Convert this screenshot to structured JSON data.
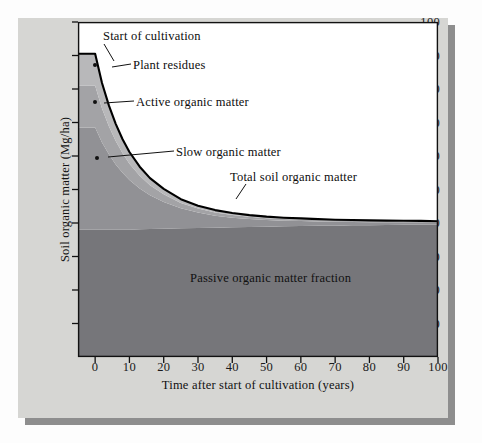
{
  "figure": {
    "panel_color": "#d6d6d3",
    "shadow_color": "#8e8e8e",
    "plot_background": "#ffffff",
    "frame_color": "#111111"
  },
  "chart_data": {
    "type": "area",
    "title": "",
    "xlabel": "Time after start of cultivation (years)",
    "ylabel": "Soil organic matter (Mg/ha)",
    "xlim": [
      -5,
      100
    ],
    "ylim": [
      0,
      100
    ],
    "grid": false,
    "legend_position": "none",
    "stacked": true,
    "xticks": [
      0,
      10,
      20,
      30,
      40,
      50,
      60,
      70,
      80,
      90,
      100
    ],
    "xticklabels": [
      "0",
      "10",
      "20",
      "30",
      "40",
      "50",
      "60",
      "70",
      "80",
      "90",
      "100"
    ],
    "yticks": [
      10,
      20,
      30,
      40,
      50,
      60,
      70,
      80,
      90,
      100
    ],
    "yticklabels": [
      "10",
      "20",
      "30",
      "40",
      "50",
      "60",
      "70",
      "80",
      "90",
      "100"
    ],
    "x": [
      -5,
      0,
      2,
      4,
      6,
      8,
      10,
      13,
      16,
      20,
      25,
      30,
      35,
      40,
      45,
      50,
      55,
      60,
      65,
      70,
      75,
      80,
      85,
      90,
      95,
      100
    ],
    "series": [
      {
        "name": "Passive organic matter fraction",
        "color": "#76767a",
        "values": [
          38.0,
          38.0,
          38.0,
          38.0,
          38.0,
          38.0,
          38.0,
          38.1,
          38.2,
          38.3,
          38.4,
          38.5,
          38.6,
          38.7,
          38.8,
          38.9,
          39.0,
          39.1,
          39.15,
          39.2,
          39.3,
          39.35,
          39.4,
          39.45,
          39.5,
          39.5
        ]
      },
      {
        "name": "Slow organic matter",
        "color": "#919195",
        "values": [
          30.5,
          30.5,
          26.0,
          22.5,
          19.5,
          17.0,
          14.8,
          12.2,
          10.1,
          8.0,
          6.0,
          4.6,
          3.6,
          2.9,
          2.4,
          2.0,
          1.7,
          1.5,
          1.3,
          1.15,
          1.0,
          0.9,
          0.8,
          0.75,
          0.7,
          0.65
        ]
      },
      {
        "name": "Active organic matter",
        "color": "#a3a3a6",
        "values": [
          12.5,
          12.5,
          10.2,
          8.4,
          7.0,
          5.8,
          4.9,
          3.8,
          3.0,
          2.3,
          1.6,
          1.2,
          0.95,
          0.8,
          0.65,
          0.55,
          0.48,
          0.42,
          0.38,
          0.34,
          0.3,
          0.28,
          0.26,
          0.24,
          0.22,
          0.2
        ]
      },
      {
        "name": "Plant residues",
        "color": "#b8b8ba",
        "values": [
          9.5,
          9.5,
          7.6,
          6.2,
          5.1,
          4.2,
          3.5,
          2.7,
          2.1,
          1.6,
          1.1,
          0.85,
          0.7,
          0.6,
          0.5,
          0.45,
          0.4,
          0.35,
          0.32,
          0.3,
          0.28,
          0.26,
          0.24,
          0.22,
          0.2,
          0.18
        ]
      }
    ],
    "total_curve": {
      "name": "Total soil organic matter",
      "color": "#000000",
      "values": [
        90.5,
        90.5,
        81.8,
        75.1,
        69.6,
        65.0,
        61.2,
        56.8,
        53.4,
        50.2,
        47.1,
        45.15,
        43.85,
        43.0,
        42.35,
        41.9,
        41.58,
        41.37,
        41.15,
        40.99,
        40.88,
        40.79,
        40.7,
        40.66,
        40.62,
        40.53
      ]
    },
    "annotations": [
      {
        "id": "start-of-cultivation",
        "text": "Start of cultivation"
      },
      {
        "id": "plant-residues",
        "text": "Plant residues"
      },
      {
        "id": "active-organic-matter",
        "text": "Active organic matter"
      },
      {
        "id": "slow-organic-matter",
        "text": "Slow organic matter"
      },
      {
        "id": "total-soil-organic-matter",
        "text": "Total soil organic matter"
      },
      {
        "id": "passive-organic-matter-fraction",
        "text": "Passive organic matter fraction"
      }
    ]
  }
}
